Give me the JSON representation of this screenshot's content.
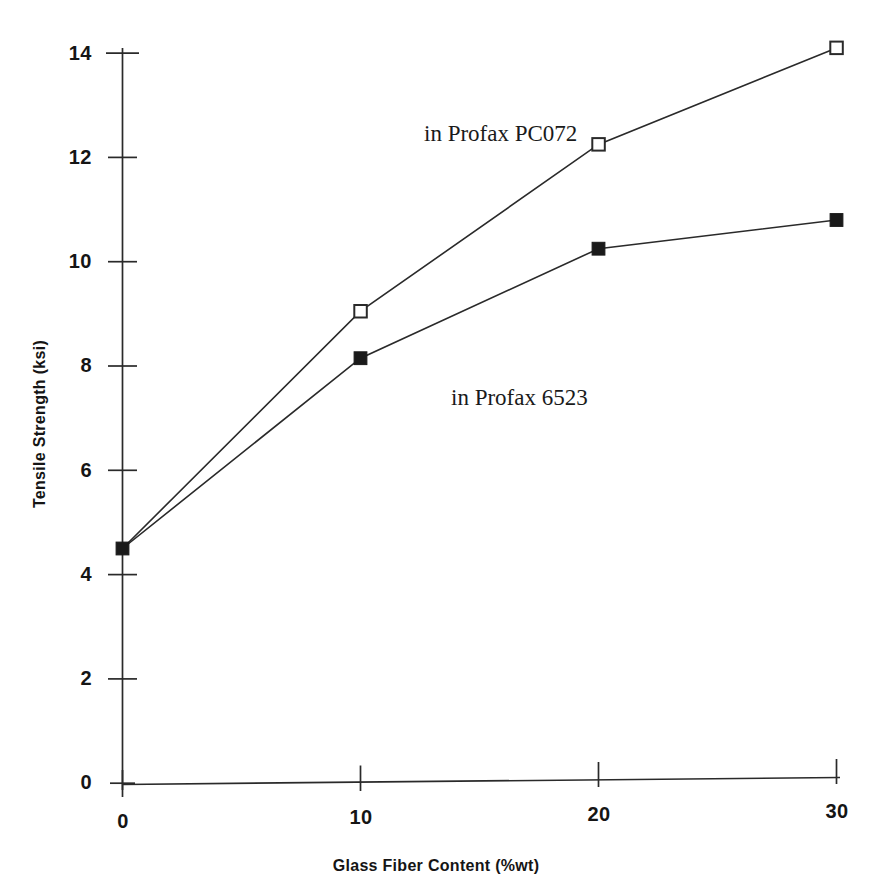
{
  "chart_data": {
    "type": "line",
    "title": "",
    "subtitle": "",
    "xlabel": "Glass Fiber Content (%wt)",
    "ylabel": "Tensile Strength (ksi)",
    "x": [
      0,
      10,
      20,
      30
    ],
    "xlim": [
      0,
      30
    ],
    "ylim": [
      0,
      14
    ],
    "xticks": [
      0,
      10,
      20,
      30
    ],
    "xtick_labels": [
      "0",
      "10",
      "20",
      "30"
    ],
    "yticks": [
      0,
      2,
      4,
      6,
      8,
      10,
      12,
      14
    ],
    "ytick_labels": [
      "0",
      "2",
      "4",
      "6",
      "8",
      "10",
      "12",
      "14"
    ],
    "grid": false,
    "legend_position": "inline-annotations",
    "series": [
      {
        "name": "in Profax PC072",
        "marker": "open-square",
        "color": "#1a1a1a",
        "x": [
          0,
          10,
          20,
          30
        ],
        "values": [
          4.5,
          9.05,
          12.25,
          14.1
        ],
        "marker_points": [
          {
            "x": 10,
            "y": 9.05
          },
          {
            "x": 20,
            "y": 12.25
          },
          {
            "x": 30,
            "y": 14.1
          }
        ]
      },
      {
        "name": "in Profax 6523",
        "marker": "filled-square",
        "color": "#1a1a1a",
        "x": [
          0,
          10,
          20,
          30
        ],
        "values": [
          4.5,
          8.15,
          10.25,
          10.8
        ],
        "marker_points": [
          {
            "x": 0,
            "y": 4.5
          },
          {
            "x": 10,
            "y": 8.15
          },
          {
            "x": 20,
            "y": 10.25
          },
          {
            "x": 30,
            "y": 10.8
          }
        ]
      }
    ],
    "annotations": [
      {
        "text": "in Profax PC072",
        "x": 10.5,
        "y": 12.7
      },
      {
        "text": "in Profax 6523",
        "x": 11.5,
        "y": 7.6
      }
    ]
  },
  "axes": {
    "y_tick_0": "0",
    "y_tick_2": "2",
    "y_tick_4": "4",
    "y_tick_6": "6",
    "y_tick_8": "8",
    "y_tick_10": "10",
    "y_tick_12": "12",
    "y_tick_14": "14",
    "x_tick_0": "0",
    "x_tick_10": "10",
    "x_tick_20": "20",
    "x_tick_30": "30",
    "xlabel": "Glass Fiber Content (%wt)",
    "ylabel": "Tensile Strength (ksi)"
  },
  "annotations": {
    "pc072": "in Profax PC072",
    "p6523": "in Profax 6523"
  },
  "colors": {
    "ink": "#1a1a1a",
    "background": "#ffffff"
  }
}
